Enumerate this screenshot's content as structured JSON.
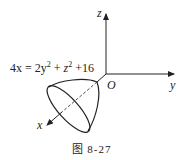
{
  "figure": {
    "caption": "图 8-27",
    "equation": {
      "lhs": "4x",
      "rhs_terms": [
        "2y",
        "2",
        "z",
        "2",
        "16"
      ],
      "full_text": "4x = 2y² + z² + 16"
    },
    "axes": {
      "x_label": "x",
      "y_label": "y",
      "z_label": "z",
      "origin_label": "O"
    },
    "surface": "elliptic paraboloid opening along x-axis"
  }
}
